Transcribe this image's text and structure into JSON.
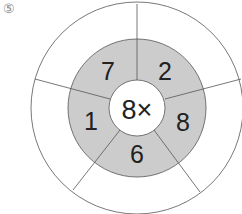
{
  "problem_label": "⑤",
  "center_text": "8×",
  "multiplier": 8,
  "ring_numbers": [
    {
      "position": "top-left",
      "value": "7"
    },
    {
      "position": "top-right",
      "value": "2"
    },
    {
      "position": "right",
      "value": "8"
    },
    {
      "position": "bottom",
      "value": "6"
    },
    {
      "position": "left",
      "value": "1"
    }
  ],
  "outer_answers": [
    "",
    "",
    "",
    "",
    ""
  ],
  "colors": {
    "ring_fill": "#cccccc",
    "line": "#555555",
    "background": "#ffffff"
  }
}
